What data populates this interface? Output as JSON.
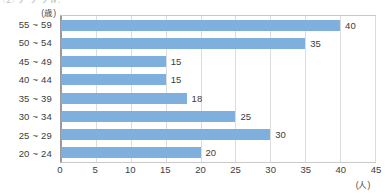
{
  "heading": {
    "clipped_text": "②グラフ化"
  },
  "axes": {
    "y_unit": "(歳)",
    "x_unit": "(人)"
  },
  "chart_data": {
    "type": "bar",
    "orientation": "horizontal",
    "title": "",
    "xlabel": "(人)",
    "ylabel": "(歳)",
    "xlim": [
      0,
      45
    ],
    "xticks": [
      0,
      5,
      10,
      15,
      20,
      25,
      30,
      35,
      40,
      45
    ],
    "grid": true,
    "legend": null,
    "bar_color": "#7fafdc",
    "categories": [
      "55 ~ 59",
      "50 ~ 54",
      "45 ~ 49",
      "40 ~ 44",
      "35 ~ 39",
      "30 ~ 34",
      "25 ~ 29",
      "20 ~ 24"
    ],
    "values": [
      40,
      35,
      15,
      15,
      18,
      25,
      30,
      20
    ],
    "data_labels": [
      "40",
      "35",
      "15",
      "15",
      "18",
      "25",
      "30",
      "20"
    ]
  }
}
